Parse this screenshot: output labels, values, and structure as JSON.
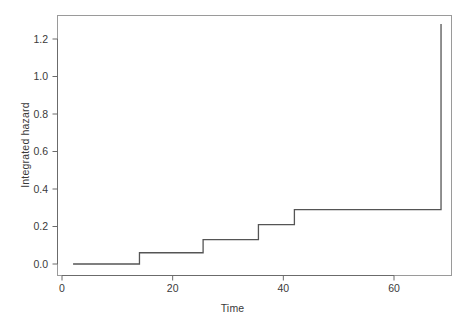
{
  "chart_data": {
    "type": "line",
    "subtype": "step-function",
    "title": "",
    "xlabel": "Time",
    "ylabel": "Integrated hazard",
    "xlim": [
      1.5,
      70.5
    ],
    "ylim": [
      -0.02,
      1.33
    ],
    "xticks": [
      0,
      20,
      40,
      60
    ],
    "xticklabels": [
      "0",
      "20",
      "40",
      "60"
    ],
    "yticks": [
      0.0,
      0.2,
      0.4,
      0.6,
      0.8,
      1.0,
      1.2
    ],
    "yticklabels": [
      "0.0",
      "0.2",
      "0.4",
      "0.6",
      "0.8",
      "1.0",
      "1.2"
    ],
    "grid": false,
    "legend": null,
    "line_color": "#555555",
    "line_width": 1.3,
    "box_color": "#9a9a9a",
    "x": [
      2.0,
      14.0,
      14.0,
      25.5,
      25.5,
      35.5,
      35.5,
      42.0,
      42.0,
      68.5,
      68.5
    ],
    "y": [
      0.0,
      0.0,
      0.06,
      0.06,
      0.13,
      0.13,
      0.21,
      0.21,
      0.29,
      0.29,
      1.28
    ],
    "steps": [
      {
        "time": 2.0,
        "hazard": 0.0
      },
      {
        "time": 14.0,
        "hazard": 0.06
      },
      {
        "time": 25.5,
        "hazard": 0.13
      },
      {
        "time": 35.5,
        "hazard": 0.21
      },
      {
        "time": 42.0,
        "hazard": 0.29
      },
      {
        "time": 68.5,
        "hazard": 1.28
      }
    ]
  }
}
